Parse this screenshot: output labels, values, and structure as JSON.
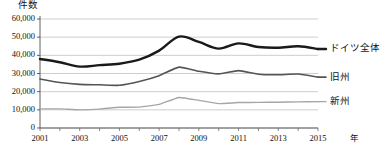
{
  "chart_data": {
    "type": "line",
    "title": "",
    "subtitle": "",
    "xlabel": "年",
    "ylabel": "件数",
    "x": [
      2001,
      2002,
      2003,
      2004,
      2005,
      2006,
      2007,
      2008,
      2009,
      2010,
      2011,
      2012,
      2013,
      2014,
      2015
    ],
    "xlim": [
      2001,
      2015
    ],
    "ylim": [
      0,
      60000
    ],
    "grid": true,
    "grid_axis": "y",
    "legend_position": "right-inline",
    "x_tick_labels": [
      "2001",
      "2003",
      "2005",
      "2007",
      "2009",
      "2011",
      "2013",
      "2015"
    ],
    "x_tick_values": [
      2001,
      2003,
      2005,
      2007,
      2009,
      2011,
      2013,
      2015
    ],
    "y_tick_labels": [
      "0",
      "10,000",
      "20,000",
      "30,000",
      "40,000",
      "50,000",
      "60,000"
    ],
    "y_tick_values": [
      0,
      10000,
      20000,
      30000,
      40000,
      50000,
      60000
    ],
    "series": [
      {
        "name": "ドイツ全体",
        "color": "#1a1a1a",
        "width": 2.4,
        "values": [
          38000,
          36200,
          33800,
          34600,
          35400,
          37600,
          42600,
          50300,
          47400,
          43700,
          46600,
          44600,
          44200,
          45000,
          43500
        ]
      },
      {
        "name": "旧州",
        "color": "#555555",
        "width": 1.6,
        "values": [
          27000,
          25000,
          24000,
          23800,
          23500,
          25600,
          28800,
          33500,
          31200,
          29800,
          31600,
          29600,
          29300,
          29700,
          28000
        ]
      },
      {
        "name": "新州",
        "color": "#a6a6a6",
        "width": 1.4,
        "values": [
          10500,
          10500,
          10000,
          10400,
          11400,
          11500,
          13000,
          16800,
          15200,
          13400,
          14000,
          14100,
          14200,
          14400,
          14500
        ]
      }
    ]
  },
  "axis": {
    "y_title": "件数",
    "x_unit": "年"
  },
  "legend": {
    "items": [
      {
        "label": "ドイツ全体"
      },
      {
        "label": "旧州"
      },
      {
        "label": "新州"
      }
    ]
  }
}
